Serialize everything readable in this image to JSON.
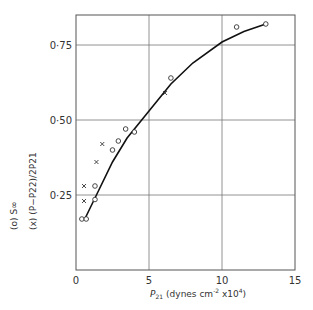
{
  "chart_data": {
    "type": "scatter",
    "title": "",
    "xlabel": "P21 (dynes cm^-2 x10^4)",
    "ylabel": "(o) S∞   (x) (P - P22) / (2 P21)",
    "xlim": [
      0,
      15
    ],
    "ylim": [
      0,
      0.87
    ],
    "x_ticks": [
      "0",
      "5",
      "10",
      "15"
    ],
    "y_ticks": [
      "0·25",
      "0·50",
      "0·75"
    ],
    "grid": true,
    "series": [
      {
        "name": "(o) S∞",
        "marker": "circle",
        "x": [
          0.4,
          0.7,
          1.3,
          1.3,
          2.5,
          2.9,
          3.4,
          4.0,
          6.5,
          11.0,
          13.0
        ],
        "y": [
          0.17,
          0.17,
          0.235,
          0.28,
          0.4,
          0.43,
          0.47,
          0.46,
          0.64,
          0.81,
          0.82
        ]
      },
      {
        "name": "(x) (P - P22)/2P21",
        "marker": "cross",
        "x": [
          0.55,
          0.55,
          1.4,
          1.8,
          6.1
        ],
        "y": [
          0.23,
          0.28,
          0.36,
          0.42,
          0.59
        ]
      },
      {
        "name": "fitted curve",
        "marker": "line",
        "x": [
          0.6,
          1.5,
          2.5,
          3.5,
          5.0,
          6.5,
          8.0,
          10.0,
          11.5,
          13.0
        ],
        "y": [
          0.17,
          0.26,
          0.36,
          0.44,
          0.53,
          0.62,
          0.69,
          0.76,
          0.795,
          0.82
        ]
      }
    ]
  },
  "labels": {
    "x_axis": "(dynes cm",
    "x_sym": "P",
    "x_sub": "21",
    "x_exp": "-2",
    "x_mult": " x10",
    "x_mult_exp": "4",
    "x_close": ")",
    "y_o": "(o)  S∞",
    "y_x": "(x)  (P−P22)/2P21"
  }
}
